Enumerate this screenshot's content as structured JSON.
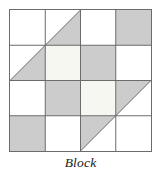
{
  "figure": {
    "caption": "Block",
    "title": "Block",
    "width": 161,
    "height": 175
  },
  "colors": {
    "background": "#ffffff",
    "white_patch": "#ffffff",
    "cream_patch": "#f7f7f2",
    "gray_patch": "#cccccc",
    "grid_line": "#6b6b6b",
    "outer_border": "#6b6b6b",
    "caption_text": "#1a1a1a"
  },
  "block": {
    "name": "Block",
    "grid_rows": 4,
    "grid_cols": 4,
    "cell_size": 35.25,
    "origin_x": 0,
    "origin_y": 0,
    "patches": [
      {
        "id": "r1c1",
        "row": 1,
        "col": 1,
        "shape": "square",
        "fill": "white"
      },
      {
        "id": "r1c2",
        "row": 1,
        "col": 2,
        "shape": "square",
        "fill": "white"
      },
      {
        "id": "r1c3",
        "row": 1,
        "col": 3,
        "shape": "square",
        "fill": "white"
      },
      {
        "id": "r1c4",
        "row": 1,
        "col": 4,
        "shape": "square",
        "fill": "gray"
      },
      {
        "id": "r2c1",
        "row": 2,
        "col": 1,
        "shape": "square",
        "fill": "white"
      },
      {
        "id": "r2c2",
        "row": 2,
        "col": 2,
        "shape": "square",
        "fill": "cream"
      },
      {
        "id": "r2c3",
        "row": 2,
        "col": 3,
        "shape": "square",
        "fill": "gray"
      },
      {
        "id": "r2c4",
        "row": 2,
        "col": 4,
        "shape": "square",
        "fill": "white"
      },
      {
        "id": "r3c1",
        "row": 3,
        "col": 1,
        "shape": "square",
        "fill": "white"
      },
      {
        "id": "r3c2",
        "row": 3,
        "col": 2,
        "shape": "square",
        "fill": "gray"
      },
      {
        "id": "r3c3",
        "row": 3,
        "col": 3,
        "shape": "square",
        "fill": "cream"
      },
      {
        "id": "r3c4",
        "row": 3,
        "col": 4,
        "shape": "square",
        "fill": "white"
      },
      {
        "id": "r4c1",
        "row": 4,
        "col": 1,
        "shape": "square",
        "fill": "gray"
      },
      {
        "id": "r4c2",
        "row": 4,
        "col": 2,
        "shape": "square",
        "fill": "white"
      },
      {
        "id": "r4c3",
        "row": 4,
        "col": 3,
        "shape": "square",
        "fill": "white"
      },
      {
        "id": "r4c4",
        "row": 4,
        "col": 4,
        "shape": "square",
        "fill": "white"
      }
    ],
    "triangles": [
      {
        "id": "top-left-half-square-triangle",
        "quadrant": "top-left",
        "fill": "gray",
        "points": "0,70.5 70.5,0 70.5,70.5",
        "description": "gray lower-right half of the top-left 2x2 unit"
      },
      {
        "id": "bottom-right-half-square-triangle",
        "quadrant": "bottom-right",
        "fill": "gray",
        "points": "70.5,70.5 141,70.5 70.5,141",
        "description": "gray upper-left half of the bottom-right 2x2 unit"
      }
    ],
    "overlay_patches": [
      {
        "id": "overlay-r2c2",
        "row": 2,
        "col": 2,
        "fill": "cream"
      },
      {
        "id": "overlay-r3c3",
        "row": 3,
        "col": 3,
        "fill": "cream"
      }
    ],
    "grid_lines": {
      "vertical_x": [
        0,
        35.25,
        70.5,
        105.75,
        141
      ],
      "horizontal_y": [
        0,
        35.25,
        70.5,
        105.75,
        141
      ],
      "stroke_width": 1
    }
  }
}
